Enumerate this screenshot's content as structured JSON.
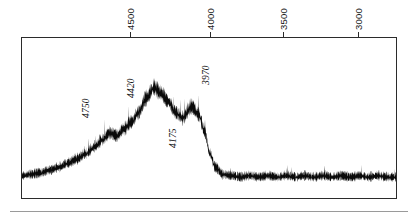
{
  "figure": {
    "title": "",
    "background_color": "#ffffff",
    "trace_color": "#0a0a0a",
    "frame_color": "#2b2b2b",
    "width": 418,
    "height": 220
  },
  "axis": {
    "position": "top",
    "orientation": "horizontal",
    "label_rotation": "vertical",
    "direction": "decreasing",
    "ticks": [
      {
        "label": "4500",
        "x": 130
      },
      {
        "label": "4000",
        "x": 210
      },
      {
        "label": "3500",
        "x": 283
      },
      {
        "label": "3000",
        "x": 358
      }
    ]
  },
  "annotations": [
    {
      "label": "4750",
      "x": 85,
      "y": 118
    },
    {
      "label": "4420",
      "x": 130,
      "y": 98
    },
    {
      "label": "4175",
      "x": 172,
      "y": 148
    },
    {
      "label": "3970",
      "x": 205,
      "y": 85
    }
  ],
  "chart_data": {
    "type": "line",
    "title": "",
    "subtitle": "",
    "xlabel": "",
    "ylabel": "",
    "xlim": [
      4900,
      2850
    ],
    "ylim": [
      0,
      1
    ],
    "grid": false,
    "legend": null,
    "axis_on_top": true,
    "tick_labels": [
      "4500",
      "4000",
      "3500",
      "3000"
    ],
    "tick_values": [
      4500,
      4000,
      3500,
      3000
    ],
    "annotation_labels": [
      "4750",
      "4420",
      "4175",
      "3970"
    ],
    "annotation_values": [
      4750,
      4420,
      4175,
      3970
    ],
    "series": [
      {
        "name": "spectrum",
        "description": "Noisy spectral trace: flat low baseline at the blue (left) end, a rising ramp to a broad strong emission hump peaking near 4175, a secondary structured bump near 3970, a sharp drop just redward of 3900, then a flat noisy baseline to the red (right) end.",
        "x": [
          4900,
          4850,
          4800,
          4750,
          4700,
          4650,
          4600,
          4550,
          4500,
          4460,
          4420,
          4380,
          4340,
          4300,
          4260,
          4220,
          4175,
          4140,
          4100,
          4060,
          4020,
          3970,
          3930,
          3900,
          3870,
          3840,
          3800,
          3750,
          3700,
          3650,
          3600,
          3550,
          3500,
          3450,
          3400,
          3350,
          3300,
          3250,
          3200,
          3150,
          3100,
          3050,
          3000,
          2950,
          2900,
          2850
        ],
        "values": [
          0.16,
          0.17,
          0.18,
          0.2,
          0.22,
          0.25,
          0.28,
          0.32,
          0.37,
          0.42,
          0.47,
          0.45,
          0.5,
          0.55,
          0.62,
          0.72,
          0.8,
          0.76,
          0.7,
          0.62,
          0.58,
          0.66,
          0.6,
          0.48,
          0.32,
          0.22,
          0.17,
          0.16,
          0.15,
          0.16,
          0.15,
          0.16,
          0.15,
          0.16,
          0.15,
          0.16,
          0.15,
          0.16,
          0.15,
          0.16,
          0.15,
          0.16,
          0.15,
          0.16,
          0.15,
          0.15
        ],
        "noise_amplitude": 0.11
      }
    ]
  }
}
